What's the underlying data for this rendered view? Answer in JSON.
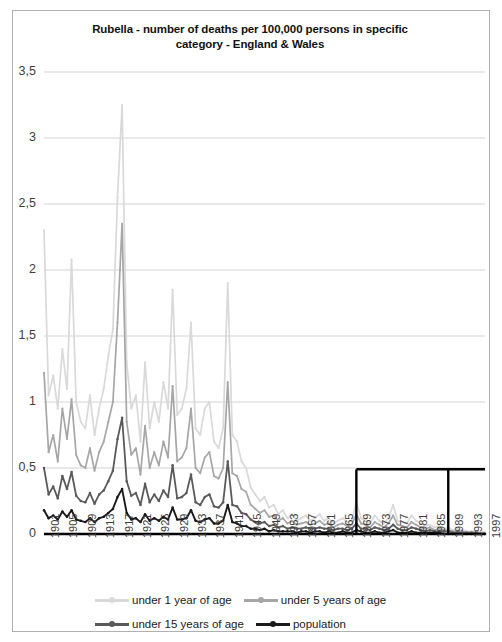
{
  "chart_data": {
    "type": "line",
    "title": "Rubella - number of deaths per 100,000  persons in specific category - England & Wales",
    "title_line1": "Rubella - number of deaths per 100,000  persons in specific",
    "title_line2": "category - England & Wales",
    "xlabel": "",
    "ylabel": "",
    "ylim": [
      0,
      3.5
    ],
    "xlim": [
      1901,
      1997
    ],
    "yticks": [
      "0",
      "0,5",
      "1",
      "1,5",
      "2",
      "2,5",
      "3",
      "3,5"
    ],
    "ytick_values": [
      0,
      0.5,
      1,
      1.5,
      2,
      2.5,
      3,
      3.5
    ],
    "xticks": [
      "1901",
      "1905",
      "1909",
      "1913",
      "1917",
      "1921",
      "1925",
      "1929",
      "1933",
      "1937",
      "1941",
      "1945",
      "1949",
      "1953",
      "1957",
      "1961",
      "1965",
      "1969",
      "1973",
      "1977",
      "1981",
      "1985",
      "1989",
      "1993",
      "1997"
    ],
    "grid": "horizontal",
    "legend_position": "bottom",
    "x": [
      1901,
      1902,
      1903,
      1904,
      1905,
      1906,
      1907,
      1908,
      1909,
      1910,
      1911,
      1912,
      1913,
      1914,
      1915,
      1916,
      1917,
      1918,
      1919,
      1920,
      1921,
      1922,
      1923,
      1924,
      1925,
      1926,
      1927,
      1928,
      1929,
      1930,
      1931,
      1932,
      1933,
      1934,
      1935,
      1936,
      1937,
      1938,
      1939,
      1940,
      1941,
      1942,
      1943,
      1944,
      1945,
      1946,
      1947,
      1948,
      1949,
      1950,
      1951,
      1952,
      1953,
      1954,
      1955,
      1956,
      1957,
      1958,
      1959,
      1960,
      1961,
      1962,
      1963,
      1964,
      1965,
      1966,
      1967,
      1968,
      1969,
      1970,
      1971,
      1972,
      1973,
      1974,
      1975,
      1976,
      1977,
      1978,
      1979,
      1980,
      1981,
      1982,
      1983,
      1984,
      1985,
      1986,
      1987,
      1988,
      1989,
      1990,
      1991,
      1992,
      1993,
      1994,
      1995,
      1996,
      1997
    ],
    "series": [
      {
        "name": "under 1 year of age",
        "color": "#d9d9d9",
        "values": [
          2.3,
          1.05,
          1.2,
          0.95,
          1.4,
          1.1,
          2.08,
          1.0,
          0.85,
          0.8,
          1.05,
          0.75,
          0.95,
          1.1,
          1.35,
          1.55,
          2.55,
          3.25,
          1.3,
          0.95,
          1.05,
          0.7,
          1.3,
          0.8,
          1.0,
          0.85,
          1.15,
          0.95,
          1.85,
          0.9,
          0.95,
          1.1,
          1.6,
          0.8,
          0.75,
          0.95,
          1.0,
          0.7,
          0.65,
          0.8,
          1.9,
          0.75,
          0.7,
          0.55,
          0.5,
          0.35,
          0.3,
          0.25,
          0.28,
          0.2,
          0.22,
          0.15,
          0.18,
          0.12,
          0.15,
          0.1,
          0.12,
          0.14,
          0.1,
          0.12,
          0.15,
          0.1,
          0.12,
          0.08,
          0.1,
          0.12,
          0.09,
          0.1,
          0.24,
          0.12,
          0.1,
          0.08,
          0.14,
          0.1,
          0.08,
          0.12,
          0.22,
          0.1,
          0.09,
          0.08,
          0.14,
          0.1,
          0.08,
          0.06,
          0.07,
          0.05,
          0.06,
          0.04,
          0.05,
          0.03,
          0.04,
          0.03,
          0.02,
          0.02,
          0.02,
          0.01,
          0.01
        ]
      },
      {
        "name": "under 5 years of age",
        "color": "#a6a6a6",
        "values": [
          1.22,
          0.62,
          0.75,
          0.55,
          0.95,
          0.72,
          1.02,
          0.6,
          0.52,
          0.5,
          0.65,
          0.48,
          0.62,
          0.7,
          0.85,
          1.0,
          1.6,
          2.35,
          0.85,
          0.6,
          0.65,
          0.45,
          0.82,
          0.5,
          0.62,
          0.52,
          0.7,
          0.58,
          1.12,
          0.55,
          0.58,
          0.65,
          0.95,
          0.5,
          0.46,
          0.58,
          0.62,
          0.44,
          0.42,
          0.5,
          1.15,
          0.46,
          0.44,
          0.34,
          0.32,
          0.22,
          0.19,
          0.16,
          0.18,
          0.13,
          0.14,
          0.1,
          0.12,
          0.08,
          0.1,
          0.07,
          0.08,
          0.09,
          0.07,
          0.08,
          0.1,
          0.07,
          0.08,
          0.05,
          0.07,
          0.08,
          0.06,
          0.07,
          0.15,
          0.08,
          0.07,
          0.05,
          0.09,
          0.07,
          0.05,
          0.08,
          0.14,
          0.07,
          0.06,
          0.05,
          0.09,
          0.07,
          0.05,
          0.04,
          0.05,
          0.03,
          0.04,
          0.03,
          0.03,
          0.02,
          0.02,
          0.02,
          0.01,
          0.01,
          0.01,
          0.01,
          0.01
        ]
      },
      {
        "name": "under 15 years of age",
        "color": "#5a5a5a",
        "values": [
          0.5,
          0.3,
          0.36,
          0.27,
          0.44,
          0.34,
          0.47,
          0.29,
          0.25,
          0.24,
          0.31,
          0.23,
          0.3,
          0.33,
          0.4,
          0.48,
          0.72,
          0.88,
          0.4,
          0.29,
          0.31,
          0.22,
          0.38,
          0.24,
          0.3,
          0.25,
          0.33,
          0.28,
          0.52,
          0.27,
          0.28,
          0.31,
          0.45,
          0.24,
          0.22,
          0.28,
          0.3,
          0.21,
          0.2,
          0.24,
          0.55,
          0.22,
          0.21,
          0.16,
          0.15,
          0.11,
          0.09,
          0.08,
          0.09,
          0.06,
          0.07,
          0.05,
          0.06,
          0.04,
          0.05,
          0.04,
          0.04,
          0.05,
          0.04,
          0.04,
          0.05,
          0.04,
          0.04,
          0.03,
          0.04,
          0.04,
          0.03,
          0.04,
          0.08,
          0.04,
          0.04,
          0.03,
          0.05,
          0.04,
          0.03,
          0.04,
          0.07,
          0.04,
          0.03,
          0.03,
          0.05,
          0.04,
          0.03,
          0.02,
          0.03,
          0.02,
          0.02,
          0.02,
          0.02,
          0.01,
          0.01,
          0.01,
          0.01,
          0.01,
          0.01,
          0.0,
          0.0
        ]
      },
      {
        "name": "population",
        "color": "#1a1a1a",
        "values": [
          0.18,
          0.12,
          0.14,
          0.11,
          0.17,
          0.13,
          0.18,
          0.11,
          0.1,
          0.09,
          0.12,
          0.09,
          0.12,
          0.13,
          0.16,
          0.19,
          0.28,
          0.34,
          0.16,
          0.11,
          0.12,
          0.09,
          0.15,
          0.1,
          0.12,
          0.1,
          0.13,
          0.11,
          0.2,
          0.11,
          0.11,
          0.12,
          0.18,
          0.1,
          0.09,
          0.11,
          0.12,
          0.08,
          0.08,
          0.1,
          0.22,
          0.09,
          0.08,
          0.06,
          0.06,
          0.04,
          0.04,
          0.03,
          0.04,
          0.02,
          0.03,
          0.02,
          0.02,
          0.02,
          0.02,
          0.01,
          0.02,
          0.02,
          0.01,
          0.02,
          0.02,
          0.01,
          0.02,
          0.01,
          0.01,
          0.02,
          0.01,
          0.01,
          0.03,
          0.02,
          0.01,
          0.01,
          0.02,
          0.01,
          0.01,
          0.02,
          0.03,
          0.01,
          0.01,
          0.01,
          0.02,
          0.01,
          0.01,
          0.01,
          0.01,
          0.01,
          0.01,
          0.0,
          0.0,
          0.0,
          0.0,
          0.0,
          0.0,
          0.0,
          0.0,
          0.0,
          0.0
        ]
      }
    ],
    "annotation_box": {
      "label": "black-outline-overlay",
      "color": "#000000",
      "x_start": 1969,
      "x_end": 1997,
      "x_divider": 1989,
      "y_level": 0.49
    }
  },
  "legend": {
    "rows": [
      [
        {
          "label": "under 1 year of age",
          "color": "#d9d9d9"
        },
        {
          "label": "under 5 years of age",
          "color": "#a6a6a6"
        }
      ],
      [
        {
          "label": "under 15 years of age",
          "color": "#5a5a5a"
        },
        {
          "label": "population",
          "color": "#1a1a1a"
        }
      ]
    ]
  }
}
